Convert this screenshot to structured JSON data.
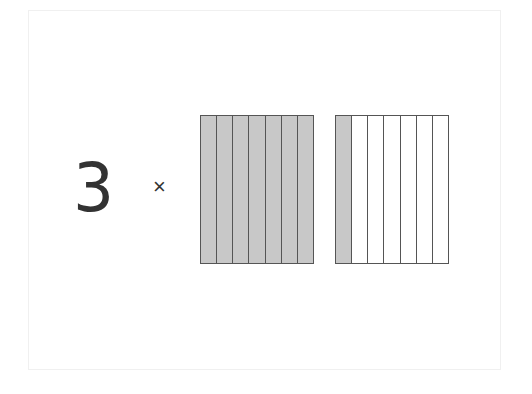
{
  "expression": {
    "multiplier": "3",
    "operator": "×"
  },
  "fraction_model": {
    "columns_per_whole": 7,
    "wholes": [
      {
        "shaded": 7,
        "total": 7
      },
      {
        "shaded": 1,
        "total": 7
      }
    ],
    "represents": "8/7 (1 1/7)"
  },
  "colors": {
    "shaded": "#c8c8c8",
    "empty": "#ffffff",
    "outline": "#555555",
    "text": "#333333"
  }
}
